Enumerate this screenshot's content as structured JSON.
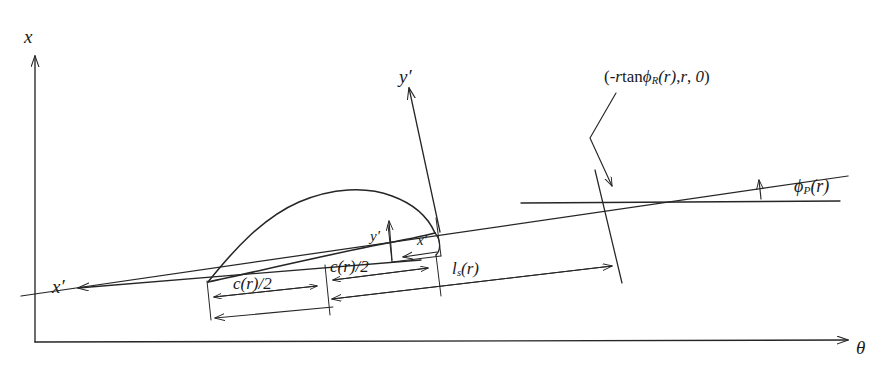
{
  "figure": {
    "background_color": "#ffffff",
    "line_color": "#262626",
    "label_color": "#1a1a1a"
  },
  "axes": {
    "vertical": {
      "name": "x-axis",
      "label": "x"
    },
    "horizontal": {
      "name": "theta-axis",
      "label": "θ"
    }
  },
  "blade_axes": {
    "y_prime": {
      "name": "y-prime-axis",
      "label": "y′"
    },
    "x_prime": {
      "name": "x-prime-axis",
      "label": "x′"
    }
  },
  "local_axes": {
    "y_prime": {
      "label": "y′"
    },
    "x_prime": {
      "label": "x′"
    }
  },
  "annotations": {
    "point_coordinate": {
      "prefix": "(-",
      "r1": "r",
      "tan": "tan",
      "phi": "ϕ",
      "sub_R": "R",
      "arg1": "(r)",
      "comma1": ",",
      "r2": "r",
      "comma2": ",",
      "zero": "0",
      "suffix": ")",
      "full": "(-r tanϕR(r), r, 0)"
    },
    "pitch_angle": {
      "phi": "ϕ",
      "sub_P": "P",
      "arg": "(r)",
      "full": "ϕP(r)"
    },
    "chord_half_first": "c(r)/2",
    "chord_half_second": "c(r)/2",
    "stacking_length": {
      "l": "l",
      "sub_s": "s",
      "arg": "(r)",
      "full": "ls(r)"
    }
  }
}
